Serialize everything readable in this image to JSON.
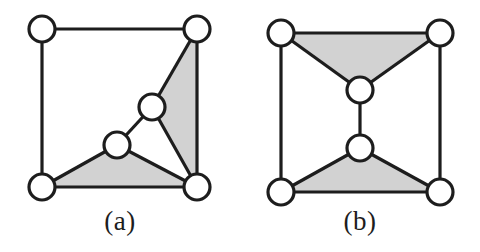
{
  "figure": {
    "background_color": "#ffffff",
    "stroke_color": "#1d1d1d",
    "node_fill_color": "#ffffff",
    "shading_color": "#d2d2d2",
    "node_radius": 13,
    "edge_width": 3.2,
    "node_stroke_width": 3.2
  },
  "panels": [
    {
      "id": "a",
      "caption": "(a)",
      "nodes": [
        {
          "id": "tl",
          "name": "top-left-node",
          "cx": 42,
          "cy": 29
        },
        {
          "id": "tr",
          "name": "top-right-node",
          "cx": 197,
          "cy": 29
        },
        {
          "id": "bl",
          "name": "bottom-left-node",
          "cx": 42,
          "cy": 187
        },
        {
          "id": "br",
          "name": "bottom-right-node",
          "cx": 197,
          "cy": 187
        },
        {
          "id": "i1",
          "name": "inner-upper-node",
          "cx": 152,
          "cy": 107
        },
        {
          "id": "i2",
          "name": "inner-lower-node",
          "cx": 117,
          "cy": 145
        }
      ],
      "edges": [
        {
          "from": "tl",
          "to": "tr"
        },
        {
          "from": "tl",
          "to": "bl"
        },
        {
          "from": "tr",
          "to": "br"
        },
        {
          "from": "bl",
          "to": "br"
        },
        {
          "from": "tr",
          "to": "i1"
        },
        {
          "from": "i1",
          "to": "br"
        },
        {
          "from": "i1",
          "to": "i2"
        },
        {
          "from": "i2",
          "to": "bl"
        },
        {
          "from": "i2",
          "to": "br"
        }
      ],
      "shaded_faces": [
        {
          "name": "shaded-triangle-right",
          "vertices": [
            "tr",
            "i1",
            "br"
          ]
        },
        {
          "name": "shaded-triangle-bottom",
          "vertices": [
            "i2",
            "bl",
            "br"
          ]
        }
      ]
    },
    {
      "id": "b",
      "caption": "(b)",
      "nodes": [
        {
          "id": "tl",
          "name": "top-left-node",
          "cx": 41,
          "cy": 33
        },
        {
          "id": "tr",
          "name": "top-right-node",
          "cx": 200,
          "cy": 33
        },
        {
          "id": "bl",
          "name": "bottom-left-node",
          "cx": 41,
          "cy": 192
        },
        {
          "id": "br",
          "name": "bottom-right-node",
          "cx": 200,
          "cy": 192
        },
        {
          "id": "m1",
          "name": "middle-upper-node",
          "cx": 120,
          "cy": 90
        },
        {
          "id": "m2",
          "name": "middle-lower-node",
          "cx": 120,
          "cy": 148
        }
      ],
      "edges": [
        {
          "from": "tl",
          "to": "tr"
        },
        {
          "from": "tl",
          "to": "bl"
        },
        {
          "from": "tr",
          "to": "br"
        },
        {
          "from": "bl",
          "to": "br"
        },
        {
          "from": "tl",
          "to": "m1"
        },
        {
          "from": "tr",
          "to": "m1"
        },
        {
          "from": "m1",
          "to": "m2"
        },
        {
          "from": "m2",
          "to": "bl"
        },
        {
          "from": "m2",
          "to": "br"
        }
      ],
      "shaded_faces": [
        {
          "name": "shaded-triangle-top",
          "vertices": [
            "tl",
            "tr",
            "m1"
          ]
        },
        {
          "name": "shaded-triangle-bottom",
          "vertices": [
            "m2",
            "bl",
            "br"
          ]
        }
      ]
    }
  ]
}
